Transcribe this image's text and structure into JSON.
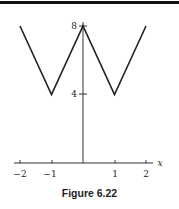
{
  "chart_data": {
    "type": "line",
    "title": "Figure 6.22",
    "xlabel": "x",
    "ylabel": "",
    "xlim": [
      -2.2,
      2.3
    ],
    "ylim": [
      0,
      8.2
    ],
    "x_ticks": [
      -2,
      -1,
      1,
      2
    ],
    "x_tick_labels": [
      "−2",
      "−1",
      "1",
      "2"
    ],
    "y_ticks": [
      4,
      8
    ],
    "y_tick_labels": [
      "4",
      "8"
    ],
    "grid": false,
    "legend": null,
    "series": [
      {
        "name": "f(x)",
        "x": [
          -2,
          -1,
          0,
          1,
          2
        ],
        "y": [
          8,
          4,
          8,
          4,
          8
        ],
        "color": "#222222"
      }
    ]
  },
  "caption": "Figure 6.22"
}
